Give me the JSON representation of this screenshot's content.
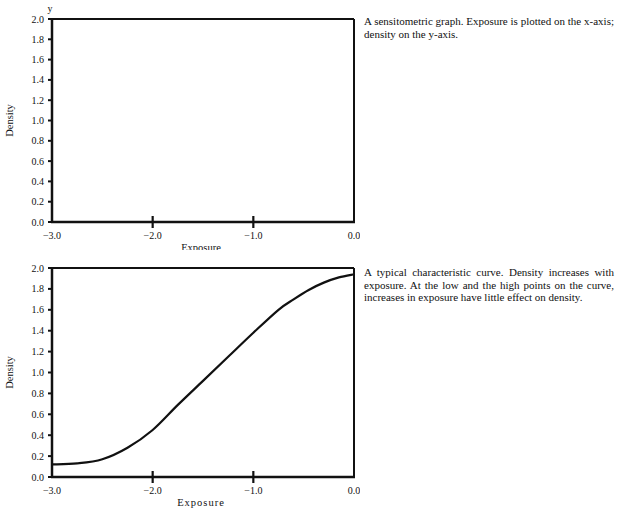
{
  "chart_data": [
    {
      "type": "line",
      "title": "",
      "caption": "A sensitometric graph. Exposure is plotted on the x-axis; density on the y-axis.",
      "xlabel": "Exposure",
      "ylabel": "Density",
      "x_axis_letter": "x",
      "y_axis_letter": "y",
      "xlim": [
        -3.0,
        0.0
      ],
      "ylim": [
        0.0,
        2.0
      ],
      "x_ticks": [
        "-3.0",
        "-2.0",
        "-1.0",
        "0.0"
      ],
      "y_ticks": [
        "0.0",
        "0.2",
        "0.4",
        "0.6",
        "0.8",
        "1.0",
        "1.2",
        "1.4",
        "1.6",
        "1.8",
        "2.0"
      ],
      "grid": false,
      "series": []
    },
    {
      "type": "line",
      "title": "",
      "caption": "A typical characteristic curve. Density increases with exposure. At the low and the high points on the curve, increases in exposure have little effect on density.",
      "xlabel": "Exposure",
      "ylabel": "Density",
      "xlim": [
        -3.0,
        0.0
      ],
      "ylim": [
        0.0,
        2.0
      ],
      "x_ticks": [
        "-3.0",
        "-2.0",
        "-1.0",
        "0.0"
      ],
      "y_ticks": [
        "0.0",
        "0.2",
        "0.4",
        "0.6",
        "0.8",
        "1.0",
        "1.2",
        "1.4",
        "1.6",
        "1.8",
        "2.0"
      ],
      "grid": false,
      "series": [
        {
          "name": "Characteristic curve",
          "x": [
            -3.0,
            -2.75,
            -2.5,
            -2.25,
            -2.0,
            -1.75,
            -1.5,
            -1.25,
            -1.0,
            -0.75,
            -0.6,
            -0.45,
            -0.3,
            -0.15,
            0.0
          ],
          "y": [
            0.12,
            0.13,
            0.17,
            0.28,
            0.45,
            0.69,
            0.92,
            1.15,
            1.38,
            1.6,
            1.7,
            1.79,
            1.86,
            1.91,
            1.94
          ]
        }
      ]
    }
  ],
  "captions": {
    "top": "A sensitometric graph. Exposure is plotted on the x-axis; density on the y-axis.",
    "bottom": "A typical characteristic curve. Density increases with exposure. At the low and the high points on the curve, increases in exposure have little effect on density."
  }
}
